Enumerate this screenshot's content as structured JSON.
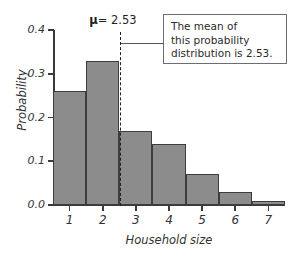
{
  "chart_data": {
    "type": "bar",
    "title": "",
    "xlabel": "Household size",
    "ylabel": "Probability",
    "categories": [
      "1",
      "2",
      "3",
      "4",
      "5",
      "6",
      "7"
    ],
    "values": [
      0.26,
      0.33,
      0.17,
      0.14,
      0.07,
      0.03,
      0.01
    ],
    "ylim": [
      0.0,
      0.4
    ],
    "xlim": [
      0.5,
      7.5
    ],
    "y_ticks": [
      "0.0",
      "0.1",
      "0.2",
      "0.3",
      "0.4"
    ],
    "y_tick_values": [
      0.0,
      0.1,
      0.2,
      0.3,
      0.4
    ],
    "x_ticks": [
      "1",
      "2",
      "3",
      "4",
      "5",
      "6",
      "7"
    ],
    "grid": false,
    "legend": null,
    "bar_color": "#8c8c8c",
    "bar_edge_color": "#3d3d3d",
    "annotations": [
      {
        "name": "mean-line",
        "type": "vline",
        "x": 2.53,
        "label": "μ = 2.53",
        "style": "dashed",
        "color": "#1f1f1f"
      },
      {
        "name": "callout",
        "type": "textbox",
        "line1": "The mean of",
        "line2": "this probability",
        "line3": "distribution is 2.53.",
        "border_color": "#6b6b7a"
      }
    ]
  },
  "axes": {
    "y_label": "Probability",
    "x_label": "Household size",
    "y_tick_labels": [
      "0.0",
      "0.1",
      "0.2",
      "0.3",
      "0.4"
    ],
    "x_tick_labels": [
      "1",
      "2",
      "3",
      "4",
      "5",
      "6",
      "7"
    ]
  },
  "mean_marker": {
    "mu_symbol": "μ",
    "equals_value": "= 2.53",
    "full_label": "μ = 2.53"
  },
  "callout": {
    "line1": "The mean of",
    "line2": "this probability",
    "line3": "distribution is 2.53."
  }
}
